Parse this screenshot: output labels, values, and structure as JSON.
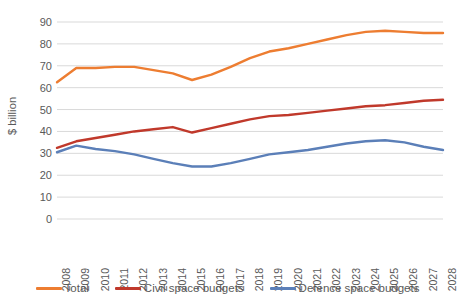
{
  "chart_data": {
    "type": "line",
    "title": "",
    "xlabel": "",
    "ylabel": "$ billion",
    "ylim": [
      0,
      90
    ],
    "ytick_step": 10,
    "grid": true,
    "legend_position": "bottom",
    "yticks": [
      "90",
      "80",
      "70",
      "60",
      "50",
      "40",
      "30",
      "20",
      "10",
      "0"
    ],
    "categories": [
      "2008",
      "2009",
      "2010",
      "2011",
      "2012",
      "2013",
      "2014",
      "2015",
      "2016",
      "2017",
      "2018",
      "2019",
      "2020",
      "2021",
      "2022",
      "2023",
      "2024",
      "2025",
      "2026",
      "2027",
      "2028"
    ],
    "series": [
      {
        "name": "Total",
        "color": "#ED7D31",
        "values": [
          62.5,
          69.0,
          69.0,
          69.5,
          69.5,
          68.0,
          66.5,
          63.5,
          66.0,
          69.5,
          73.5,
          76.5,
          78.0,
          80.0,
          82.0,
          84.0,
          85.5,
          86.0,
          85.5,
          85.0,
          85.0
        ]
      },
      {
        "name": "Civil space budgets",
        "color": "#C0392B",
        "values": [
          32.5,
          35.5,
          37.0,
          38.5,
          40.0,
          41.0,
          42.0,
          39.5,
          41.5,
          43.5,
          45.5,
          47.0,
          47.5,
          48.5,
          49.5,
          50.5,
          51.5,
          52.0,
          53.0,
          54.0,
          54.5
        ]
      },
      {
        "name": "Defence space budgets",
        "color": "#5B7FB8",
        "values": [
          30.5,
          33.5,
          32.0,
          31.0,
          29.5,
          27.5,
          25.5,
          24.0,
          24.0,
          25.5,
          27.5,
          29.5,
          30.5,
          31.5,
          33.0,
          34.5,
          35.5,
          36.0,
          35.0,
          33.0,
          31.5
        ]
      }
    ]
  },
  "legend": {
    "items": [
      {
        "label": "Total",
        "color": "#ED7D31"
      },
      {
        "label": "Civil space budgets",
        "color": "#C0392B"
      },
      {
        "label": "Defence space budgets",
        "color": "#5B7FB8"
      }
    ]
  }
}
